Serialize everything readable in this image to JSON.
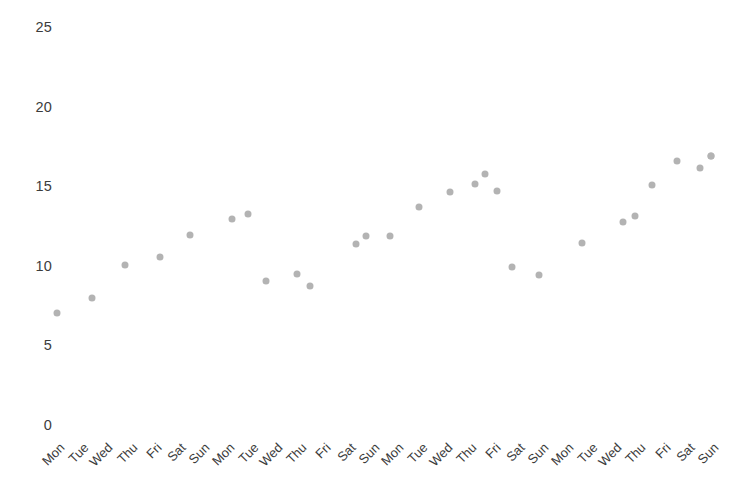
{
  "chart_data": {
    "type": "scatter",
    "title": "",
    "xlabel": "",
    "ylabel": "",
    "ylim": [
      0,
      26.5
    ],
    "yticks": [
      0,
      5,
      10,
      15,
      20,
      25
    ],
    "ytick_labels": [
      "0",
      "5",
      "10",
      "15",
      "20",
      "25"
    ],
    "grid": false,
    "legend": false,
    "marker_color": "#b3b3b3",
    "marker_size_px": 7,
    "axis_text_color": "#3c3c3c",
    "background_color": "#ffffff",
    "categories": [
      "Mon",
      "Tue",
      "Wed",
      "Thu",
      "Fri",
      "Sat",
      "Sun",
      "Mon",
      "Tue",
      "Wed",
      "Thu",
      "Fri",
      "Sat",
      "Sun",
      "Mon",
      "Tue",
      "Wed",
      "Thu",
      "Fri",
      "Sat",
      "Sun",
      "Mon",
      "Tue",
      "Wed",
      "Thu",
      "Fri",
      "Sat",
      "Sun"
    ],
    "x": [
      1,
      2,
      3,
      4,
      5,
      6,
      7,
      8,
      9,
      10,
      11,
      12,
      13,
      14,
      15,
      16,
      17,
      18,
      19,
      20,
      21,
      22,
      23,
      24,
      25,
      26,
      27,
      28
    ],
    "values": [
      7.0,
      7.9,
      10.1,
      10.5,
      12.0,
      12.9,
      13.3,
      9.2,
      9.7,
      8.8,
      11.5,
      11.9,
      11.9,
      13.7,
      14.7,
      15.1,
      15.8,
      14.7,
      10.1,
      9.5,
      11.5,
      12.8,
      13.2,
      15.1,
      16.5,
      16.1,
      16.8,
      16.7
    ],
    "pixel_points": [
      {
        "x": 57,
        "y": 313
      },
      {
        "x": 92,
        "y": 298
      },
      {
        "x": 125,
        "y": 265
      },
      {
        "x": 160,
        "y": 257
      },
      {
        "x": 190,
        "y": 235
      },
      {
        "x": 232,
        "y": 219
      },
      {
        "x": 248,
        "y": 214
      },
      {
        "x": 266,
        "y": 281
      },
      {
        "x": 297,
        "y": 274
      },
      {
        "x": 310,
        "y": 286
      },
      {
        "x": 356,
        "y": 244
      },
      {
        "x": 366,
        "y": 236
      },
      {
        "x": 390,
        "y": 236
      },
      {
        "x": 419,
        "y": 207
      },
      {
        "x": 450,
        "y": 192
      },
      {
        "x": 475,
        "y": 184
      },
      {
        "x": 485,
        "y": 174
      },
      {
        "x": 497,
        "y": 191
      },
      {
        "x": 512,
        "y": 267
      },
      {
        "x": 539,
        "y": 275
      },
      {
        "x": 582,
        "y": 243
      },
      {
        "x": 623,
        "y": 222
      },
      {
        "x": 635,
        "y": 216
      },
      {
        "x": 652,
        "y": 185
      },
      {
        "x": 677,
        "y": 161
      },
      {
        "x": 700,
        "y": 168
      },
      {
        "x": 711,
        "y": 156
      },
      {
        "x": 711,
        "y": 156
      }
    ]
  },
  "axes": {
    "y_axis_label_x": 52,
    "x_axis_baseline_y": 434,
    "y_value_at_zero_px": 425,
    "pixels_per_unit": 15.92
  }
}
